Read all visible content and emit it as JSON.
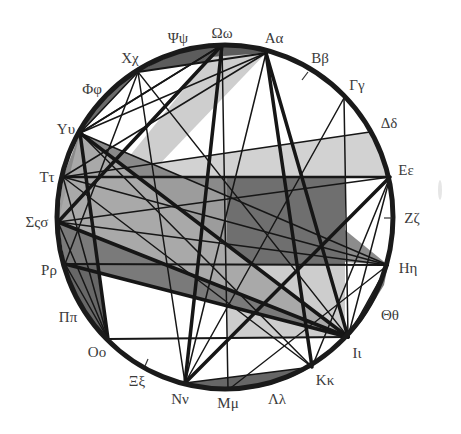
{
  "diagram": {
    "circle": {
      "cx": 225,
      "cy": 217,
      "rx": 168,
      "ry": 172,
      "stroke": "#1a1a1a",
      "stroke_width": 5
    },
    "labels": {
      "psi": "Ψψ",
      "omega": "Ωω",
      "alpha": "Αα",
      "beta": "Ββ",
      "gamma": "Γγ",
      "delta": "Δδ",
      "epsilon": "Εε",
      "zeta": "Ζζ",
      "eta": "Ηη",
      "theta": "Θθ",
      "iota": "Ιι",
      "kappa": "Κκ",
      "lambda": "Λλ",
      "mu": "Μμ",
      "nu": "Νν",
      "xi": "Ξξ",
      "omicron": "Οο",
      "pi": "Ππ",
      "rho": "Ρρ",
      "sigma": "Σςσ",
      "tau": "Ττ",
      "upsilon": "Υυ",
      "phi": "Φφ",
      "chi": "Χχ"
    },
    "vertices": {
      "omega": [
        222,
        45
      ],
      "alpha": [
        266,
        53
      ],
      "beta": [
        308,
        72
      ],
      "gamma": [
        344,
        98
      ],
      "delta": [
        370,
        132
      ],
      "epsilon": [
        390,
        177
      ],
      "zeta": [
        393,
        218
      ],
      "eta": [
        388,
        265
      ],
      "theta": [
        373,
        303
      ],
      "iota": [
        348,
        337
      ],
      "kappa": [
        312,
        367
      ],
      "lambda": [
        270,
        385
      ],
      "mu": [
        228,
        390
      ],
      "nu": [
        185,
        383
      ],
      "xi": [
        145,
        366
      ],
      "omicron": [
        108,
        339
      ],
      "pi": [
        80,
        305
      ],
      "rho": [
        65,
        264
      ],
      "sigma": [
        58,
        222
      ],
      "tau": [
        63,
        177
      ],
      "upsilon": [
        80,
        133
      ],
      "phi": [
        104,
        97
      ],
      "chi": [
        138,
        72
      ],
      "psi": [
        178,
        52
      ]
    },
    "ticks": [
      {
        "at": [
          308,
          72
        ],
        "to": [
          302,
          80
        ]
      },
      {
        "at": [
          392,
          218
        ],
        "to": [
          384,
          218
        ]
      },
      {
        "at": [
          145,
          366
        ],
        "to": [
          148,
          359
        ]
      }
    ],
    "regions": [
      {
        "name": "top-arc-dark-segment",
        "fill": "#5c5c5c",
        "points": [
          [
            138,
            72
          ],
          [
            155,
            63
          ],
          [
            178,
            53
          ],
          [
            200,
            47
          ],
          [
            222,
            44
          ],
          [
            244,
            46
          ],
          [
            266,
            53
          ]
        ]
      },
      {
        "name": "upper-left-arc-segment",
        "fill": "#6a6a6a",
        "points": [
          [
            138,
            72
          ],
          [
            120,
            83
          ],
          [
            104,
            97
          ],
          [
            90,
            113
          ],
          [
            80,
            133
          ],
          [
            95,
            118
          ]
        ]
      },
      {
        "name": "upper-light-triangle",
        "fill": "#cecece",
        "points": [
          [
            210,
            57
          ],
          [
            266,
            53
          ],
          [
            152,
            172
          ],
          [
            115,
            174
          ]
        ]
      },
      {
        "name": "tau-delta-epsilon-band",
        "fill": "#d2d2d2",
        "points": [
          [
            63,
            177
          ],
          [
            370,
            132
          ],
          [
            390,
            177
          ]
        ]
      },
      {
        "name": "left-mid-band",
        "fill": "#9c9c9c",
        "points": [
          [
            63,
            177
          ],
          [
            227,
            177
          ],
          [
            227,
            265
          ],
          [
            65,
            264
          ],
          [
            58,
            222
          ]
        ]
      },
      {
        "name": "upsilon-wedge",
        "fill": "#8a8a8a",
        "points": [
          [
            80,
            133
          ],
          [
            227,
            196
          ],
          [
            227,
            177
          ],
          [
            63,
            177
          ]
        ]
      },
      {
        "name": "dark-rectangle",
        "fill": "#6f6f6f",
        "points": [
          [
            227,
            177
          ],
          [
            345,
            177
          ],
          [
            345,
            265
          ],
          [
            227,
            265
          ]
        ]
      },
      {
        "name": "light-rectangle",
        "fill": "#cdcdcd",
        "points": [
          [
            227,
            265
          ],
          [
            345,
            265
          ],
          [
            345,
            338
          ],
          [
            227,
            338
          ]
        ]
      },
      {
        "name": "eta-wedge",
        "fill": "#8c8c8c",
        "points": [
          [
            345,
            230
          ],
          [
            388,
            265
          ],
          [
            345,
            262
          ]
        ]
      },
      {
        "name": "upper-iota-wedge",
        "fill": "#a9a9a9",
        "points": [
          [
            80,
            133
          ],
          [
            348,
            337
          ],
          [
            58,
            222
          ]
        ]
      },
      {
        "name": "lower-iota-wedge",
        "fill": "#7a7a7a",
        "points": [
          [
            58,
            222
          ],
          [
            348,
            337
          ],
          [
            65,
            264
          ]
        ]
      },
      {
        "name": "left-arc-dark-sliver",
        "fill": "#676767",
        "points": [
          [
            65,
            264
          ],
          [
            72,
            287
          ],
          [
            80,
            305
          ],
          [
            93,
            323
          ],
          [
            108,
            339
          ],
          [
            96,
            262
          ]
        ]
      },
      {
        "name": "bottom-arc-dark-segment",
        "fill": "#666666",
        "points": [
          [
            185,
            383
          ],
          [
            210,
            389
          ],
          [
            228,
            390
          ],
          [
            250,
            389
          ],
          [
            270,
            385
          ],
          [
            292,
            377
          ],
          [
            312,
            367
          ]
        ]
      },
      {
        "name": "right-arc-sliver",
        "fill": "#7a7a7a",
        "points": [
          [
            388,
            265
          ],
          [
            384,
            285
          ],
          [
            373,
            303
          ],
          [
            362,
            321
          ],
          [
            348,
            337
          ]
        ]
      }
    ],
    "edges": [
      [
        "omega",
        "sigma",
        3.5
      ],
      [
        "omega",
        "nu",
        3.5
      ],
      [
        "alpha",
        "iota",
        3.5
      ],
      [
        "alpha",
        "kappa",
        3.5
      ],
      [
        "epsilon",
        "nu",
        3.5
      ],
      [
        "upsilon",
        "iota",
        3.5
      ],
      [
        "sigma",
        "iota",
        3.5
      ],
      [
        "rho",
        "iota",
        3.5
      ],
      [
        "upsilon",
        "omicron",
        3.5
      ],
      [
        "tau",
        "epsilon",
        2.5
      ],
      [
        "chi",
        "alpha",
        2.2
      ],
      [
        "rho",
        "eta",
        2
      ],
      [
        "omicron",
        "iota",
        2
      ],
      [
        "omega",
        "mu",
        1.5
      ],
      [
        "alpha",
        "nu",
        1.5
      ],
      [
        "alpha",
        "upsilon",
        1.5
      ],
      [
        "alpha",
        "tau",
        1.5
      ],
      [
        "chi",
        "nu",
        1.5
      ],
      [
        "chi",
        "rho",
        1.5
      ],
      [
        "gamma",
        "iota",
        1.5
      ],
      [
        "gamma",
        "nu",
        1.5
      ],
      [
        "tau",
        "delta",
        1.5
      ],
      [
        "upsilon",
        "eta",
        1.5
      ],
      [
        "tau",
        "eta",
        1.5
      ],
      [
        "sigma",
        "eta",
        1.5
      ],
      [
        "mu",
        "eta",
        1.3
      ],
      [
        "epsilon",
        "iota",
        1.5
      ],
      [
        "epsilon",
        "kappa",
        1.5
      ],
      [
        "epsilon",
        "sigma",
        1.5
      ],
      [
        "eta",
        "iota",
        1.5
      ],
      [
        "nu",
        "kappa",
        1.5
      ],
      [
        "tau",
        "omicron",
        1.5
      ],
      [
        "sigma",
        "omicron",
        1.5
      ],
      [
        "rho",
        "omicron",
        1.5
      ],
      [
        "upsilon",
        "kappa",
        1.5
      ],
      [
        "chi",
        "upsilon",
        1.5
      ],
      [
        "upsilon",
        "omega",
        1.5
      ],
      [
        "tau",
        "kappa",
        1.5
      ],
      [
        "chi",
        "iota",
        1.3
      ],
      [
        "omega",
        "upsilon",
        1.5
      ]
    ]
  }
}
